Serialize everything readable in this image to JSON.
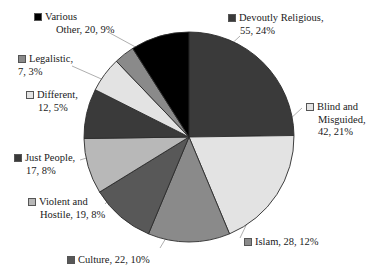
{
  "chart_data": {
    "type": "pie",
    "title": "",
    "subtitle": "",
    "xlabel": "",
    "ylabel": "",
    "legend_position": "callout-labels",
    "grid": false,
    "total": 232,
    "categories": [
      "Devoutly Religious",
      "Blind and Misguided",
      "Islam",
      "Culture",
      "Violent and Hostile",
      "Just People",
      "Different",
      "Legalistic",
      "Various Other"
    ],
    "values": [
      55,
      42,
      28,
      22,
      19,
      17,
      12,
      7,
      20
    ],
    "percents": [
      24,
      21,
      12,
      10,
      8,
      8,
      5,
      3,
      9
    ],
    "colors": [
      "#3a3a3a",
      "#e3e3e3",
      "#8a8a8a",
      "#585858",
      "#b8b8b8",
      "#3a3a3a",
      "#e3e3e3",
      "#8a8a8a",
      "#000000"
    ],
    "slices": [
      {
        "name": "Devoutly Religious",
        "value": 55,
        "percent": 24,
        "color": "#3a3a3a",
        "label_line1": "Devoutly Religious,",
        "label_line2": "55, 24%",
        "label_line3": ""
      },
      {
        "name": "Blind and Misguided",
        "value": 42,
        "percent": 21,
        "color": "#e3e3e3",
        "label_line1": "Blind and",
        "label_line2": "Misguided,",
        "label_line3": "42, 21%"
      },
      {
        "name": "Islam",
        "value": 28,
        "percent": 12,
        "color": "#8a8a8a",
        "label_line1": "Islam, 28, 12%",
        "label_line2": "",
        "label_line3": ""
      },
      {
        "name": "Culture",
        "value": 22,
        "percent": 10,
        "color": "#585858",
        "label_line1": "Culture, 22, 10%",
        "label_line2": "",
        "label_line3": ""
      },
      {
        "name": "Violent and Hostile",
        "value": 19,
        "percent": 8,
        "color": "#b8b8b8",
        "label_line1": "Violent and",
        "label_line2": "Hostile, 19, 8%",
        "label_line3": ""
      },
      {
        "name": "Just People",
        "value": 17,
        "percent": 8,
        "color": "#3a3a3a",
        "label_line1": "Just People,",
        "label_line2": "17, 8%",
        "label_line3": ""
      },
      {
        "name": "Different",
        "value": 12,
        "percent": 5,
        "color": "#e3e3e3",
        "label_line1": "Different,",
        "label_line2": "12, 5%",
        "label_line3": ""
      },
      {
        "name": "Legalistic",
        "value": 7,
        "percent": 3,
        "color": "#8a8a8a",
        "label_line1": "Legalistic,",
        "label_line2": "7, 3%",
        "label_line3": ""
      },
      {
        "name": "Various Other",
        "value": 20,
        "percent": 9,
        "color": "#000000",
        "label_line1": "Various",
        "label_line2": "Other, 20, 9%",
        "label_line3": ""
      }
    ],
    "geometry": {
      "center_x": 189,
      "center_y": 137,
      "radius": 105,
      "start_angle_deg": 0,
      "direction": "clockwise"
    },
    "style": {
      "slice_outline": "#2b2b2b",
      "leader_line": "#999999",
      "background": "#ffffff",
      "text": "#1a1a1a"
    }
  }
}
